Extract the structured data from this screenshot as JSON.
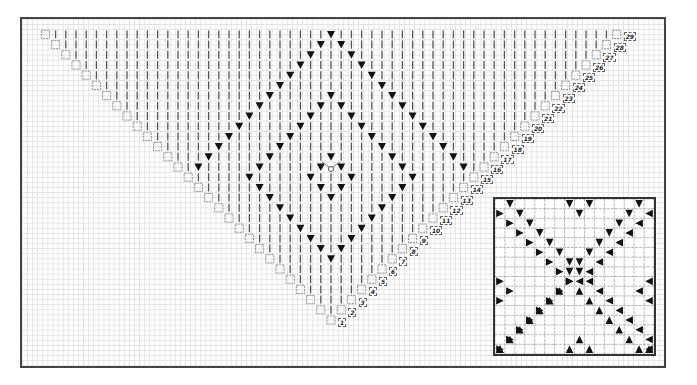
{
  "diagram": {
    "type": "knitting-chart",
    "main_chart": {
      "shape": "inverted-triangle",
      "rows": 29,
      "row_labels": [
        "1",
        "2",
        "3",
        "4",
        "5",
        "6",
        "7",
        "8",
        "9",
        "10",
        "11",
        "12",
        "13",
        "14",
        "15",
        "16",
        "17",
        "18",
        "19",
        "20",
        "21",
        "22",
        "23",
        "24",
        "25",
        "26",
        "27",
        "28",
        "29"
      ],
      "cell_px": 10.2,
      "tip_x": 331,
      "row1_y": 320,
      "symbols": {
        "knit": "vertical-bar",
        "decrease": "black-down-triangle",
        "center_start": "circle-with-loops",
        "edge": "dashed-square"
      },
      "diamonds": [
        {
          "name": "outer",
          "top_row": 29,
          "bottom_row": 1,
          "half_width": 14
        },
        {
          "name": "middle",
          "top_row": 23,
          "bottom_row": 7,
          "half_width": 8
        },
        {
          "name": "inner",
          "top_row": 17,
          "bottom_row": 13,
          "half_width": 2
        }
      ]
    },
    "inset_chart": {
      "shape": "square",
      "cells": 16,
      "pattern": "x-cross-of-triangles",
      "symbols": [
        "black-right-triangle",
        "black-down-triangle",
        "black-up-triangle",
        "black-left-triangle"
      ]
    },
    "colors": {
      "grid": "#e2e2e2",
      "frame": "#444444",
      "symbol": "#111111",
      "knit_bar": "#555555"
    }
  }
}
